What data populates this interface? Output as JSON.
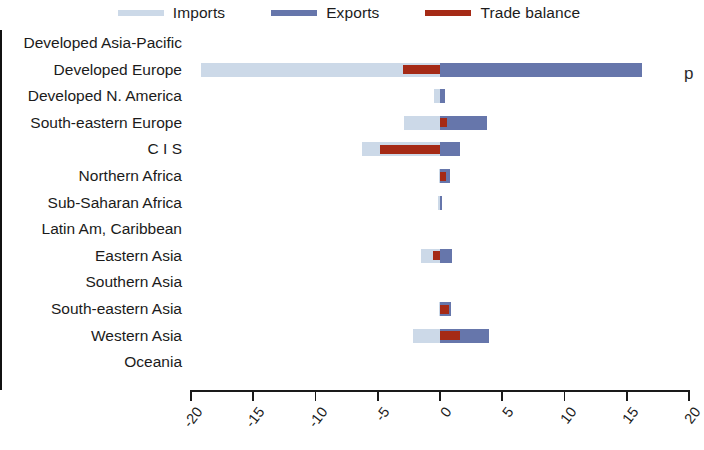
{
  "legend": {
    "items": [
      {
        "label": "Imports",
        "color": "#ccd9e8",
        "name": "imports"
      },
      {
        "label": "Exports",
        "color": "#6676ab",
        "name": "exports"
      },
      {
        "label": "Trade balance",
        "color": "#a52a16",
        "name": "trade-balance"
      }
    ]
  },
  "artifact": {
    "text": "p"
  },
  "chart_data": {
    "type": "bar",
    "orientation": "horizontal",
    "title": "",
    "xlabel": "",
    "ylabel": "",
    "xlim": [
      -20,
      20
    ],
    "xticks": [
      -20,
      -15,
      -10,
      -5,
      0,
      5,
      10,
      15,
      20
    ],
    "xticklabels": [
      "-20",
      "-15",
      "-10",
      "-5",
      "0",
      "5",
      "10",
      "15",
      "20"
    ],
    "grid": false,
    "legend_position": "top",
    "categories": [
      "Developed Asia-Pacific",
      "Developed Europe",
      "Developed N. America",
      "South-eastern Europe",
      "C I S",
      "Northern Africa",
      "Sub-Saharan Africa",
      "Latin Am, Caribbean",
      "Eastern Asia",
      "Southern Asia",
      "South-eastern Asia",
      "Western Asia",
      "Oceania"
    ],
    "series": [
      {
        "name": "Imports",
        "color": "#ccd9e8",
        "values": [
          0,
          -19.2,
          -0.5,
          -2.9,
          -6.3,
          -0.1,
          -0.2,
          0,
          -1.5,
          0,
          -0.1,
          -2.2,
          0
        ]
      },
      {
        "name": "Exports",
        "color": "#6676ab",
        "values": [
          0,
          16.2,
          0.4,
          3.8,
          1.6,
          0.8,
          0.2,
          0,
          1.0,
          0,
          0.9,
          3.9,
          0
        ]
      },
      {
        "name": "Trade balance",
        "color": "#a52a16",
        "values": [
          0,
          -3.0,
          0,
          0.6,
          -4.8,
          0.5,
          0,
          0,
          -0.6,
          0,
          0.7,
          1.6,
          0
        ]
      }
    ]
  }
}
